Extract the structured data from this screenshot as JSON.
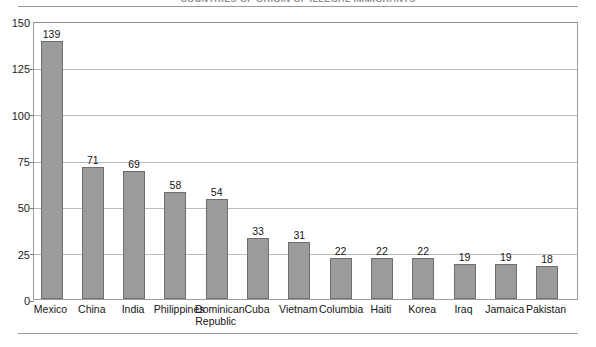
{
  "chart_data": {
    "type": "bar",
    "title": "COUNTRIES OF ORIGIN OF ILLEGAL IMMIGRANTS",
    "xlabel": "",
    "ylabel": "",
    "ylim": [
      0,
      150
    ],
    "yticks": [
      0,
      25,
      50,
      75,
      100,
      125,
      150
    ],
    "grid": true,
    "legend": "none",
    "categories": [
      "Mexico",
      "China",
      "India",
      "Philippines",
      "Dominican\nRepublic",
      "Cuba",
      "Vietnam",
      "Columbia",
      "Haiti",
      "Korea",
      "Iraq",
      "Jamaica",
      "Pakistan"
    ],
    "values": [
      139,
      71,
      69,
      58,
      54,
      33,
      31,
      22,
      22,
      22,
      19,
      19,
      18
    ],
    "bar_color": "#9b9b9b",
    "bar_border_color": "#6f6f6f",
    "gridline_color": "#bcbcbc",
    "frame_color": "#9d9d9d",
    "background_color": "#ffffff"
  }
}
